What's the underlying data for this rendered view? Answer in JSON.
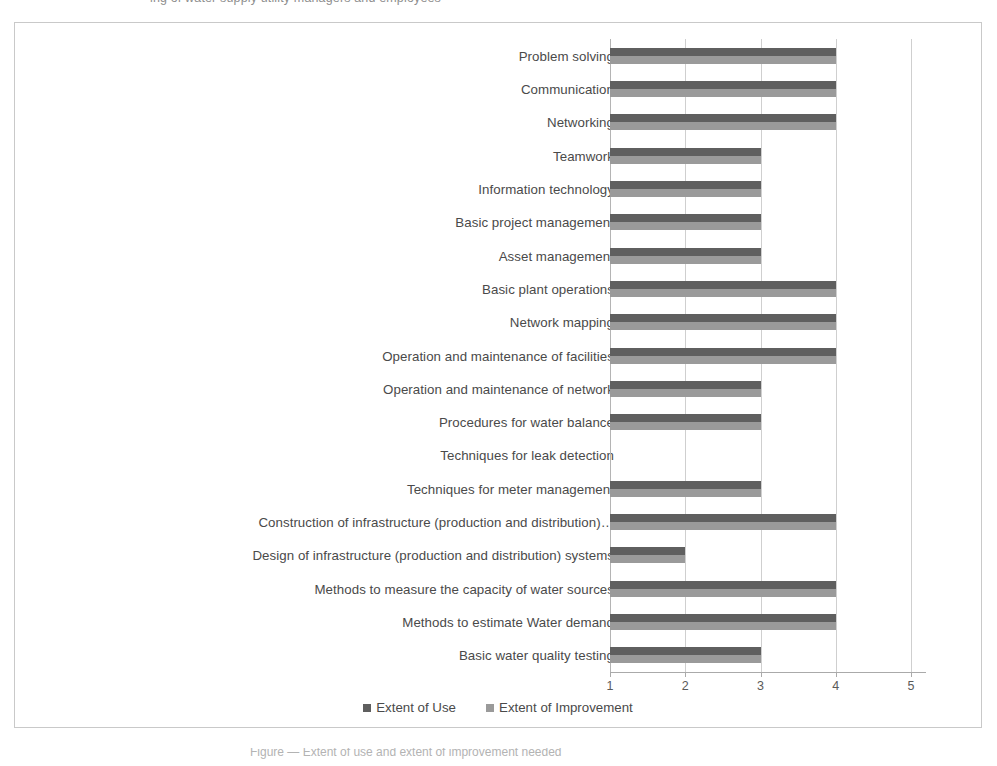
{
  "page": {
    "top_caption": "ing of water supply utility managers and employees",
    "bottom_caption": "Figure — Extent of use and extent of improvement needed"
  },
  "legend": {
    "position": "bottom-center",
    "items": [
      {
        "label": "Extent of Use",
        "color": "#5f5f5f",
        "icon": "square-swatch-icon"
      },
      {
        "label": "Extent of Improvement",
        "color": "#9a9a9a",
        "icon": "square-swatch-icon"
      }
    ]
  },
  "axis": {
    "x_ticks": [
      "1",
      "2",
      "3",
      "4",
      "5"
    ]
  },
  "chart_data": {
    "type": "bar",
    "orientation": "horizontal",
    "title": "",
    "subtitle": "",
    "xlabel": "",
    "ylabel": "",
    "xlim": [
      1,
      5
    ],
    "xticks": [
      1,
      2,
      3,
      4,
      5
    ],
    "grid": true,
    "legend_position": "bottom-center",
    "categories": [
      "Problem solving",
      "Communication",
      "Networking",
      "Teamwork",
      "Information technology",
      "Basic project management",
      "Asset management",
      "Basic plant operations",
      "Network mapping",
      "Operation and maintenance of facilities",
      "Operation and maintenance of network",
      "Procedures for water balance",
      "Techniques  for leak detection",
      "Techniques for meter management",
      "Construction of infrastructure (production and distribution)…",
      "Design of infrastructure (production and distribution) systems",
      "Methods to measure the capacity of water sources",
      "Methods to estimate Water demand",
      "Basic water quality testing"
    ],
    "series": [
      {
        "name": "Extent of Use",
        "color": "#5f5f5f",
        "values": [
          4,
          4,
          4,
          3,
          3,
          3,
          3,
          4,
          4,
          4,
          3,
          3,
          null,
          3,
          4,
          2,
          4,
          4,
          3
        ]
      },
      {
        "name": "Extent of Improvement",
        "color": "#9a9a9a",
        "values": [
          4,
          4,
          4,
          3,
          3,
          3,
          3,
          4,
          4,
          4,
          3,
          3,
          null,
          3,
          4,
          2,
          4,
          4,
          3
        ]
      }
    ]
  }
}
